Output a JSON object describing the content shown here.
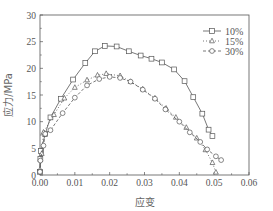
{
  "chart_data": {
    "type": "line",
    "title": "",
    "xlabel": "应变",
    "ylabel": "应力/MPa",
    "xlim": [
      0,
      0.06
    ],
    "ylim": [
      0,
      30
    ],
    "xticks": [
      0.0,
      0.01,
      0.02,
      0.03,
      0.04,
      0.05,
      0.06
    ],
    "xtick_labels": [
      "0.00",
      "0.01",
      "0.02",
      "0.03",
      "0.04",
      "0.05",
      "0.06"
    ],
    "yticks": [
      0,
      5,
      10,
      15,
      20,
      25,
      30
    ],
    "ytick_labels": [
      "0",
      "5",
      "10",
      "15",
      "20",
      "25",
      "30"
    ],
    "grid": false,
    "legend_position": "upper right",
    "series": [
      {
        "name": "10%",
        "marker": "square",
        "line_style": "solid",
        "x": [
          0.0,
          0.0001,
          0.0003,
          0.0015,
          0.003,
          0.006,
          0.0095,
          0.013,
          0.0158,
          0.0186,
          0.022,
          0.0255,
          0.0289,
          0.032,
          0.035,
          0.0385,
          0.0415,
          0.044,
          0.0466,
          0.0484,
          0.0495
        ],
        "y": [
          0.6,
          3.0,
          4.5,
          7.7,
          10.8,
          14.3,
          17.9,
          21.0,
          23.2,
          24.2,
          24.1,
          23.2,
          22.4,
          21.8,
          21.1,
          19.8,
          17.6,
          14.6,
          11.5,
          8.5,
          7.3
        ]
      },
      {
        "name": "15%",
        "marker": "triangle",
        "line_style": "dotted",
        "x": [
          0.0,
          0.0005,
          0.001,
          0.004,
          0.007,
          0.01,
          0.0135,
          0.0165,
          0.019,
          0.023,
          0.026,
          0.0295,
          0.033,
          0.0362,
          0.039,
          0.042,
          0.045,
          0.0475,
          0.0495,
          0.0505
        ],
        "y": [
          1.0,
          4.0,
          8.0,
          11.3,
          14.4,
          16.4,
          17.8,
          18.7,
          19.0,
          18.6,
          17.5,
          16.1,
          14.4,
          12.5,
          10.8,
          8.9,
          6.9,
          4.7,
          2.3,
          0.5
        ]
      },
      {
        "name": "30%",
        "marker": "circle",
        "line_style": "dashed",
        "x": [
          0.0,
          0.0001,
          0.001,
          0.0015,
          0.003,
          0.0065,
          0.01,
          0.0135,
          0.017,
          0.02,
          0.023,
          0.026,
          0.0295,
          0.033,
          0.036,
          0.04,
          0.043,
          0.046,
          0.048,
          0.0505,
          0.052
        ],
        "y": [
          0.6,
          2.7,
          5.5,
          7.7,
          8.4,
          11.6,
          14.5,
          16.8,
          18.0,
          18.4,
          18.2,
          17.5,
          16.0,
          14.3,
          12.3,
          10.0,
          8.0,
          6.2,
          4.8,
          3.5,
          2.8
        ]
      }
    ]
  },
  "colors": {
    "line": "#555555",
    "axis": "#555555",
    "background": "#ffffff"
  }
}
